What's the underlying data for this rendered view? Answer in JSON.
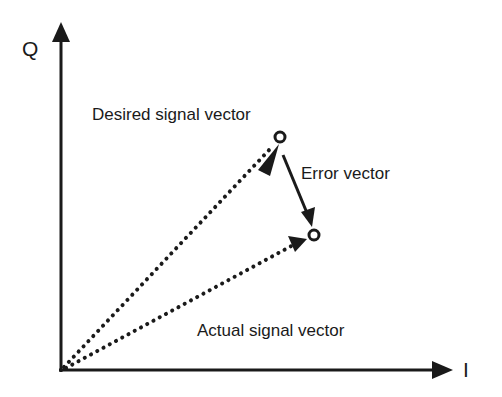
{
  "diagram": {
    "type": "IQ constellation vector diagram",
    "axes": {
      "vertical": {
        "label": "Q"
      },
      "horizontal": {
        "label": "I"
      }
    },
    "labels": {
      "desired": "Desired signal vector",
      "error": "Error vector",
      "actual": "Actual signal vector"
    },
    "colors": {
      "ink": "#1a1a1a",
      "background": "#ffffff"
    }
  }
}
